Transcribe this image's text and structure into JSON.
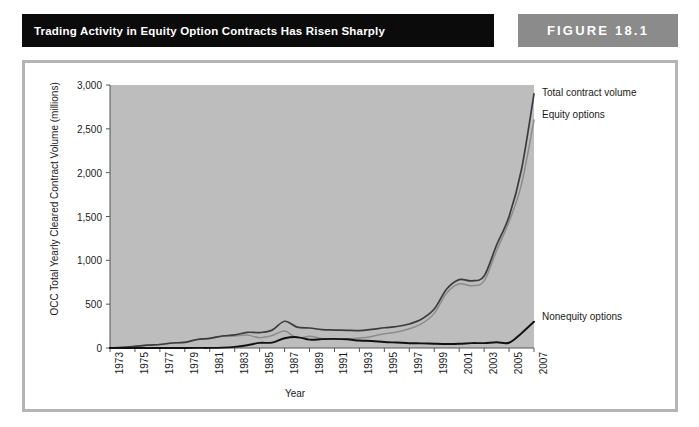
{
  "header": {
    "title": "Trading Activity in Equity Option Contracts Has Risen Sharply",
    "figure_label": "FIGURE 18.1",
    "title_bg": "#0b0b0b",
    "figure_bg": "#8b8b8b"
  },
  "chart_data": {
    "type": "line",
    "title": "Trading Activity in Equity Option Contracts Has Risen Sharply",
    "xlabel": "Year",
    "ylabel": "OCC Total Yearly Cleared Contract Volume (millions)",
    "xlim": [
      1973,
      2007
    ],
    "ylim": [
      0,
      3000
    ],
    "yticks": [
      0,
      500,
      1000,
      1500,
      2000,
      2500,
      3000
    ],
    "ytick_labels": [
      "0",
      "500",
      "1,000",
      "1,500",
      "2,000",
      "2,500",
      "3,000"
    ],
    "xticks": [
      1973,
      1975,
      1977,
      1979,
      1981,
      1983,
      1985,
      1987,
      1989,
      1991,
      1993,
      1995,
      1997,
      1999,
      2001,
      2003,
      2005,
      2007
    ],
    "xtick_labels": [
      "1973",
      "1975",
      "1977",
      "1979",
      "1981",
      "1983",
      "1985",
      "1987",
      "1989",
      "1991",
      "1993",
      "1995",
      "1997",
      "1999",
      "2001",
      "2003",
      "2005",
      "2007"
    ],
    "grid": false,
    "legend_position": "right-inline",
    "plot_bg": "#bdbdbd",
    "x": [
      1973,
      1974,
      1975,
      1976,
      1977,
      1978,
      1979,
      1980,
      1981,
      1982,
      1983,
      1984,
      1985,
      1986,
      1987,
      1988,
      1989,
      1990,
      1991,
      1992,
      1993,
      1994,
      1995,
      1996,
      1997,
      1998,
      1999,
      2000,
      2001,
      2002,
      2003,
      2004,
      2005,
      2006,
      2007
    ],
    "series": [
      {
        "name": "Total contract volume",
        "color": "#3c3c3c",
        "values": [
          1,
          6,
          18,
          32,
          40,
          57,
          65,
          97,
          110,
          137,
          149,
          179,
          176,
          204,
          305,
          238,
          228,
          210,
          205,
          202,
          198,
          212,
          231,
          245,
          274,
          330,
          444,
          673,
          780,
          766,
          822,
          1175,
          1500,
          2039,
          2900
        ]
      },
      {
        "name": "Equity options",
        "color": "#8c8c8c",
        "values": [
          1,
          6,
          18,
          32,
          40,
          57,
          65,
          96,
          109,
          133,
          136,
          147,
          118,
          142,
          194,
          114,
          133,
          109,
          101,
          103,
          113,
          132,
          163,
          183,
          219,
          277,
          395,
          627,
          732,
          710,
          766,
          1110,
          1440,
          1870,
          2600
        ]
      },
      {
        "name": "Nonequity options",
        "color": "#111111",
        "values": [
          0,
          0,
          0,
          0,
          0,
          0,
          0,
          1,
          1,
          4,
          13,
          32,
          58,
          62,
          111,
          124,
          95,
          101,
          104,
          99,
          85,
          80,
          68,
          62,
          55,
          53,
          49,
          46,
          48,
          56,
          56,
          65,
          60,
          169,
          300
        ]
      }
    ],
    "annotations": [
      {
        "text": "Total contract volume",
        "series": "Total contract volume"
      },
      {
        "text": "Equity options",
        "series": "Equity options"
      },
      {
        "text": "Nonequity options",
        "series": "Nonequity options"
      }
    ]
  }
}
